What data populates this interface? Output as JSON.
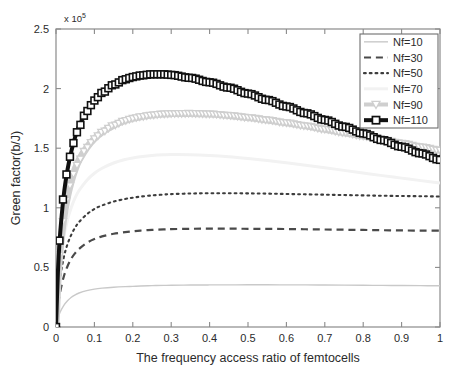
{
  "chart_data": {
    "type": "line",
    "title": "",
    "xlabel": "The frequency access ratio of femtocells",
    "ylabel": "Green factor(b/J)",
    "y_exponent_label": "x 10",
    "y_exponent_sup": "5",
    "xlim": [
      0,
      1
    ],
    "ylim": [
      0,
      250000
    ],
    "y_scale": 100000,
    "grid": false,
    "legend_position": "top-right",
    "xticks": [
      0,
      0.1,
      0.2,
      0.3,
      0.4,
      0.5,
      0.6,
      0.7,
      0.8,
      0.9,
      1
    ],
    "xtick_labels": [
      "0",
      "0.1",
      "0.2",
      "0.3",
      "0.4",
      "0.5",
      "0.6",
      "0.7",
      "0.8",
      "0.9",
      "1"
    ],
    "yticks": [
      0,
      50000,
      100000,
      150000,
      200000,
      250000
    ],
    "ytick_labels": [
      "0",
      "0.5",
      "1",
      "1.5",
      "2",
      "2.5"
    ],
    "x": [
      0,
      0.005,
      0.01,
      0.02,
      0.03,
      0.04,
      0.05,
      0.06,
      0.08,
      0.1,
      0.12,
      0.15,
      0.18,
      0.2,
      0.22,
      0.25,
      0.28,
      0.3,
      0.35,
      0.4,
      0.45,
      0.5,
      0.55,
      0.6,
      0.65,
      0.7,
      0.75,
      0.8,
      0.85,
      0.9,
      0.95,
      1
    ],
    "series": [
      {
        "name": "Nf=10",
        "label": "Nf=10",
        "color": "#c9c9c9",
        "linestyle": "solid",
        "linewidth": 1.4,
        "marker": "none",
        "values": [
          0,
          7000,
          12000,
          18000,
          22000,
          25000,
          27000,
          28500,
          30500,
          31800,
          32600,
          33400,
          33900,
          34100,
          34400,
          34700,
          34900,
          35000,
          35200,
          35300,
          35350,
          35400,
          35400,
          35350,
          35300,
          35200,
          35100,
          35000,
          34900,
          34800,
          34700,
          34600
        ]
      },
      {
        "name": "Nf=30",
        "label": "Nf=30",
        "color": "#4a4a4a",
        "linestyle": "dashed",
        "linewidth": 2.2,
        "marker": "none",
        "values": [
          0,
          17000,
          28000,
          42000,
          51000,
          57500,
          62000,
          65500,
          70500,
          73800,
          76000,
          78200,
          79600,
          80300,
          80900,
          81500,
          81900,
          82100,
          82400,
          82500,
          82500,
          82400,
          82300,
          82200,
          82000,
          81800,
          81600,
          81400,
          81200,
          81000,
          80900,
          80800
        ]
      },
      {
        "name": "Nf=50",
        "label": "Nf=50",
        "color": "#3d3d3d",
        "linestyle": "dotted",
        "linewidth": 2.1,
        "marker": "none",
        "values": [
          0,
          24000,
          39500,
          58000,
          69500,
          77500,
          83500,
          88000,
          94500,
          99000,
          102000,
          105200,
          107400,
          108500,
          109400,
          110400,
          111100,
          111500,
          112000,
          112200,
          112200,
          112100,
          111900,
          111600,
          111300,
          111000,
          110700,
          110400,
          110100,
          109900,
          109700,
          109500
        ]
      },
      {
        "name": "Nf=70",
        "label": "Nf=70",
        "color": "#f2f2f2",
        "linestyle": "solid",
        "linewidth": 3,
        "marker": "none",
        "values": [
          0,
          31000,
          51000,
          75000,
          90000,
          100500,
          108500,
          114500,
          123000,
          129000,
          133200,
          137600,
          140500,
          141800,
          142800,
          143900,
          144500,
          144700,
          144600,
          143900,
          142800,
          141300,
          139600,
          137700,
          135700,
          133600,
          131400,
          129200,
          127000,
          124900,
          122800,
          120800
        ]
      },
      {
        "name": "Nf=90",
        "label": "Nf=90",
        "color": "#cfcfcf",
        "linestyle": "solid",
        "linewidth": 7,
        "marker": "triangle-down",
        "values": [
          0,
          38000,
          62000,
          91000,
          109500,
          122500,
          132500,
          140000,
          150500,
          158000,
          163500,
          169200,
          173200,
          175000,
          176400,
          177800,
          178700,
          179000,
          179200,
          178700,
          177500,
          175800,
          173700,
          171300,
          168700,
          165900,
          163000,
          160100,
          157100,
          154100,
          151100,
          148200
        ]
      },
      {
        "name": "Nf=110",
        "label": "Nf=110",
        "color": "#111111",
        "linestyle": "solid",
        "linewidth": 4,
        "marker": "square",
        "values": [
          0,
          46000,
          75000,
          110000,
          132000,
          147500,
          159500,
          168500,
          181000,
          190000,
          196500,
          203200,
          207800,
          209700,
          211000,
          212000,
          212000,
          211500,
          209000,
          205300,
          200800,
          195800,
          190500,
          185000,
          179400,
          173700,
          168000,
          162400,
          156800,
          151200,
          145700,
          140200
        ]
      }
    ]
  },
  "legend": {
    "entries": [
      {
        "label": "Nf=10"
      },
      {
        "label": "Nf=30"
      },
      {
        "label": "Nf=50"
      },
      {
        "label": "Nf=70"
      },
      {
        "label": "Nf=90"
      },
      {
        "label": "Nf=110"
      }
    ]
  }
}
